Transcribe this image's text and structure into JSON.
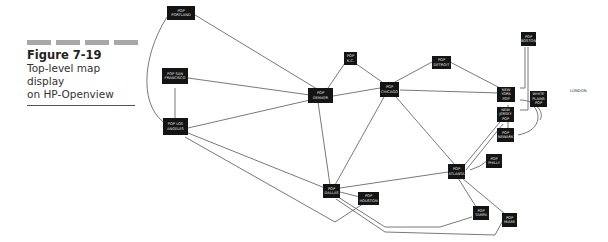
{
  "caption": {
    "figure_number": "Figure 7-19",
    "line1": "Top-level map display",
    "line2": "on HP-Openview"
  },
  "nodes": {
    "portland": {
      "label": "POP PORTLAND"
    },
    "san_francisco": {
      "label": "POP SAN FRANCISCO"
    },
    "los_angeles": {
      "label": "POP LOS ANGELES"
    },
    "denver": {
      "label": "POP DENVER"
    },
    "kc": {
      "label": "POP K.C."
    },
    "chicago": {
      "label": "POP CHICAGO"
    },
    "detroit": {
      "label": "POP DETROIT"
    },
    "boston": {
      "label": "POP BOSTON"
    },
    "new_york": {
      "label": "NEW YORK POP"
    },
    "white_plains": {
      "label": "WHITE PLAINS POP"
    },
    "new_jersey": {
      "label": "NEW JERSEY POP"
    },
    "newark": {
      "label": "POP NEWARK"
    },
    "philly": {
      "label": "POP PHILLY"
    },
    "atlanta": {
      "label": "POP ATLANTA"
    },
    "dallas": {
      "label": "POP DALLAS"
    },
    "houston": {
      "label": "POP HOUSTON"
    },
    "tampa": {
      "label": "POP TAMPA"
    },
    "miami": {
      "label": "POP MIAMI"
    }
  },
  "free_labels": {
    "london": "LONDON"
  },
  "colors": {
    "node_fill": "#141414",
    "edge": "#6a6a6a",
    "caption_bar": "#a8a8a8"
  }
}
